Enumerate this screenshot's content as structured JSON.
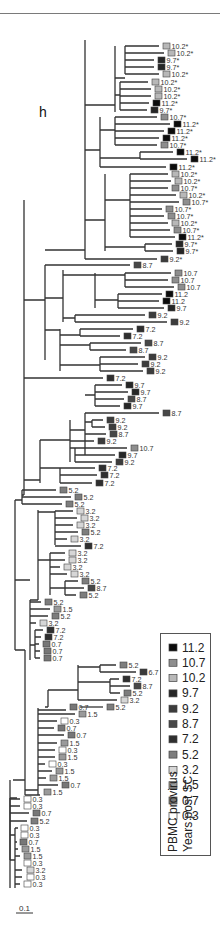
{
  "figure": {
    "panel_label": "h",
    "scale_bar": {
      "label": "0.1",
      "x1": 16,
      "x2": 33,
      "y": 913
    }
  },
  "legend": {
    "title_line1": "PBMC provirus",
    "title_line2": "Years post SC",
    "items": [
      {
        "label": "11.2",
        "color": "#0c0c0c"
      },
      {
        "label": "10.7",
        "color": "#8e8e8e"
      },
      {
        "label": "10.2",
        "color": "#b8b8b8"
      },
      {
        "label": "9.7",
        "color": "#262626"
      },
      {
        "label": "9.2",
        "color": "#3c3c3c"
      },
      {
        "label": "8.7",
        "color": "#474747"
      },
      {
        "label": "7.2",
        "color": "#2f2f2f"
      },
      {
        "label": "5.2",
        "color": "#7d7d7d"
      },
      {
        "label": "3.2",
        "color": "#d6d6d6"
      },
      {
        "label": "1.5",
        "color": "#9a9a9a"
      },
      {
        "label": "0.7",
        "color": "#777777"
      },
      {
        "label": "0.3",
        "color": "#ffffff"
      }
    ]
  },
  "chart_data": {
    "type": "phylogenetic_tree",
    "title": "h",
    "legend_title": [
      "PBMC provirus",
      "Years post SC"
    ],
    "scale_bar": "0.1",
    "leaves": [
      {
        "x": 163,
        "y": 46,
        "label": "10.2*"
      },
      {
        "x": 168,
        "y": 53,
        "label": "10.2*"
      },
      {
        "x": 158,
        "y": 60,
        "label": "9.7*"
      },
      {
        "x": 158,
        "y": 67,
        "label": "9.7*"
      },
      {
        "x": 163,
        "y": 74,
        "label": "10.2*"
      },
      {
        "x": 152,
        "y": 82,
        "label": "10.2*"
      },
      {
        "x": 155,
        "y": 89,
        "label": "10.2*"
      },
      {
        "x": 155,
        "y": 96,
        "label": "10.2*"
      },
      {
        "x": 153,
        "y": 103,
        "label": "11.2*"
      },
      {
        "x": 151,
        "y": 110,
        "label": "9.7*"
      },
      {
        "x": 161,
        "y": 117,
        "label": "10.7*"
      },
      {
        "x": 174,
        "y": 124,
        "label": "11.2*"
      },
      {
        "x": 168,
        "y": 131,
        "label": "11.2*"
      },
      {
        "x": 163,
        "y": 138,
        "label": "11.2*"
      },
      {
        "x": 161,
        "y": 145,
        "label": "10.7*"
      },
      {
        "x": 177,
        "y": 152,
        "label": "11.2*"
      },
      {
        "x": 191,
        "y": 159,
        "label": "11.2*"
      },
      {
        "x": 170,
        "y": 167,
        "label": "11.2*"
      },
      {
        "x": 172,
        "y": 174,
        "label": "10.2*"
      },
      {
        "x": 175,
        "y": 181,
        "label": "10.2*"
      },
      {
        "x": 172,
        "y": 188,
        "label": "10.7*"
      },
      {
        "x": 180,
        "y": 195,
        "label": "10.2*"
      },
      {
        "x": 183,
        "y": 202,
        "label": "10.7*"
      },
      {
        "x": 166,
        "y": 209,
        "label": "10.7*"
      },
      {
        "x": 168,
        "y": 216,
        "label": "10.7*"
      },
      {
        "x": 172,
        "y": 223,
        "label": "10.2*"
      },
      {
        "x": 174,
        "y": 230,
        "label": "10.7*"
      },
      {
        "x": 179,
        "y": 237,
        "label": "11.2*"
      },
      {
        "x": 176,
        "y": 244,
        "label": "9.7*"
      },
      {
        "x": 177,
        "y": 251,
        "label": "9.7*"
      },
      {
        "x": 161,
        "y": 259,
        "label": "9.2*"
      },
      {
        "x": 134,
        "y": 265,
        "label": "8.7"
      },
      {
        "x": 175,
        "y": 273,
        "label": "10.7"
      },
      {
        "x": 172,
        "y": 280,
        "label": "10.7"
      },
      {
        "x": 178,
        "y": 287,
        "label": "10.7"
      },
      {
        "x": 166,
        "y": 294,
        "label": "11.2"
      },
      {
        "x": 163,
        "y": 301,
        "label": "11.2"
      },
      {
        "x": 168,
        "y": 308,
        "label": "9.7"
      },
      {
        "x": 149,
        "y": 315,
        "label": "9.2"
      },
      {
        "x": 171,
        "y": 322,
        "label": "9.2"
      },
      {
        "x": 137,
        "y": 329,
        "label": "7.2"
      },
      {
        "x": 124,
        "y": 336,
        "label": "7.2"
      },
      {
        "x": 145,
        "y": 343,
        "label": "8.7"
      },
      {
        "x": 130,
        "y": 350,
        "label": "8.7"
      },
      {
        "x": 149,
        "y": 357,
        "label": "9.2"
      },
      {
        "x": 142,
        "y": 364,
        "label": "9.2"
      },
      {
        "x": 147,
        "y": 371,
        "label": "9.2"
      },
      {
        "x": 107,
        "y": 378,
        "label": "7.2"
      },
      {
        "x": 126,
        "y": 385,
        "label": "9.7"
      },
      {
        "x": 132,
        "y": 392,
        "label": "9.7"
      },
      {
        "x": 128,
        "y": 399,
        "label": "8.7"
      },
      {
        "x": 124,
        "y": 406,
        "label": "9.7"
      },
      {
        "x": 163,
        "y": 413,
        "label": "8.7"
      },
      {
        "x": 107,
        "y": 420,
        "label": "9.2"
      },
      {
        "x": 109,
        "y": 427,
        "label": "9.2"
      },
      {
        "x": 110,
        "y": 434,
        "label": "8.7"
      },
      {
        "x": 98,
        "y": 441,
        "label": "9.2"
      },
      {
        "x": 131,
        "y": 448,
        "label": "10.7"
      },
      {
        "x": 119,
        "y": 455,
        "label": "9.7"
      },
      {
        "x": 116,
        "y": 462,
        "label": "9.2"
      },
      {
        "x": 99,
        "y": 468,
        "label": "7.2"
      },
      {
        "x": 101,
        "y": 475,
        "label": "7.2"
      },
      {
        "x": 96,
        "y": 483,
        "label": "7.2"
      },
      {
        "x": 60,
        "y": 490,
        "label": "5.2"
      },
      {
        "x": 75,
        "y": 497,
        "label": "5.2"
      },
      {
        "x": 66,
        "y": 504,
        "label": "5.2"
      },
      {
        "x": 77,
        "y": 511,
        "label": "3.2"
      },
      {
        "x": 81,
        "y": 518,
        "label": "3.2"
      },
      {
        "x": 77,
        "y": 525,
        "label": "3.2"
      },
      {
        "x": 82,
        "y": 532,
        "label": "5.2"
      },
      {
        "x": 71,
        "y": 539,
        "label": "3.2"
      },
      {
        "x": 85,
        "y": 546,
        "label": "7.2"
      },
      {
        "x": 69,
        "y": 553,
        "label": "3.2"
      },
      {
        "x": 69,
        "y": 560,
        "label": "3.2"
      },
      {
        "x": 64,
        "y": 567,
        "label": "3.2"
      },
      {
        "x": 71,
        "y": 574,
        "label": "3.2"
      },
      {
        "x": 82,
        "y": 581,
        "label": "5.2"
      },
      {
        "x": 88,
        "y": 588,
        "label": "8.7"
      },
      {
        "x": 80,
        "y": 595,
        "label": "5.2"
      },
      {
        "x": 45,
        "y": 602,
        "label": "5.2"
      },
      {
        "x": 54,
        "y": 609,
        "label": "1.5"
      },
      {
        "x": 52,
        "y": 616,
        "label": "5.2"
      },
      {
        "x": 40,
        "y": 623,
        "label": "3.2"
      },
      {
        "x": 47,
        "y": 630,
        "label": "7.2"
      },
      {
        "x": 45,
        "y": 637,
        "label": "7.2"
      },
      {
        "x": 43,
        "y": 644,
        "label": "0.7"
      },
      {
        "x": 44,
        "y": 651,
        "label": "0.7"
      },
      {
        "x": 44,
        "y": 658,
        "label": "0.7"
      },
      {
        "x": 120,
        "y": 665,
        "label": "5.2"
      },
      {
        "x": 140,
        "y": 672,
        "label": "6.7"
      },
      {
        "x": 123,
        "y": 679,
        "label": "7.2"
      },
      {
        "x": 134,
        "y": 686,
        "label": "8.7"
      },
      {
        "x": 124,
        "y": 693,
        "label": "5.2"
      },
      {
        "x": 121,
        "y": 700,
        "label": "3.2"
      },
      {
        "x": 107,
        "y": 707,
        "label": "5.2"
      },
      {
        "x": 70,
        "y": 707,
        "label": "0.7"
      },
      {
        "x": 79,
        "y": 714,
        "label": "1.5"
      },
      {
        "x": 61,
        "y": 721,
        "label": "0.3"
      },
      {
        "x": 58,
        "y": 728,
        "label": "0.7"
      },
      {
        "x": 68,
        "y": 735,
        "label": "0.7"
      },
      {
        "x": 61,
        "y": 743,
        "label": "1.5"
      },
      {
        "x": 59,
        "y": 750,
        "label": "0.3"
      },
      {
        "x": 59,
        "y": 757,
        "label": "1.5"
      },
      {
        "x": 49,
        "y": 764,
        "label": "0.3"
      },
      {
        "x": 56,
        "y": 771,
        "label": "1.5"
      },
      {
        "x": 50,
        "y": 778,
        "label": "1.5"
      },
      {
        "x": 62,
        "y": 785,
        "label": "0.7"
      },
      {
        "x": 44,
        "y": 792,
        "label": "1.5"
      },
      {
        "x": 24,
        "y": 799,
        "label": "0.3"
      },
      {
        "x": 24,
        "y": 806,
        "label": "0.3"
      },
      {
        "x": 33,
        "y": 813,
        "label": "0.7"
      },
      {
        "x": 31,
        "y": 821,
        "label": "5.2"
      },
      {
        "x": 21,
        "y": 828,
        "label": "0.3"
      },
      {
        "x": 21,
        "y": 835,
        "label": "0.3"
      },
      {
        "x": 20,
        "y": 842,
        "label": "0.7"
      },
      {
        "x": 22,
        "y": 849,
        "label": "1.5"
      },
      {
        "x": 24,
        "y": 856,
        "label": "1.5"
      },
      {
        "x": 24,
        "y": 863,
        "label": "0.3"
      },
      {
        "x": 27,
        "y": 870,
        "label": "3.2"
      },
      {
        "x": 27,
        "y": 877,
        "label": "0.3"
      },
      {
        "x": 24,
        "y": 884,
        "label": "0.3"
      }
    ]
  },
  "tree": {
    "branches": [
      "M10,888 V798 M10,798 H17",
      "M10,860 H15 M15,828 V888 M15,828 H18 M15,842 H17 M15,849 H18 M15,856 H20 M15,870 H22 M15,877 H22 M15,884 H20",
      "M10,799 H20 M10,806 H20 M10,813 H29 M10,821 H27 M10,835 H15",
      "M10,780 V860",
      "M13,780 H25 M25,650 V795 M25,795 H40",
      "M25,790 H38 M38,708 V795",
      "M38,710 H66 M38,714 H75 M38,721 H57 M38,728 H54 M38,735 H64 M38,743 H57 M38,750 H55 M38,757 H55 M38,764 H45 M38,771 H52 M38,778 H46 M38,785 H58",
      "M45,707 H48 M48,690 V707",
      "M48,690 H78 M78,665 V700",
      "M78,667 H100 M100,665 V672 M100,665 H116 M100,672 H136",
      "M78,682 H110 M110,679 V693 M110,679 H119 M110,686 H130 M110,693 H120",
      "M78,700 H117",
      "M80,707 H103",
      "M15,650 V500 M15,650 H25",
      "M15,580 H30 M30,600 V660 M30,602 H41 M30,609 H50 M30,616 H48 M30,623 H36",
      "M30,645 H35 M35,630 V658 M35,630 H43 M35,637 H41 M35,644 H39 M35,651 H40 M35,658 H40",
      "M30,600 H38 M38,510 V600",
      "M38,512 H55 M55,511 V545 M55,511 H73 M55,518 H77 M55,525 H73 M55,532 H78 M55,539 H67 M55,546 H81",
      "M38,560 H50 M50,553 V595 M50,553 H65 M50,560 H65 M50,567 H60 M50,574 H67 M50,588 H65 M65,581 V595 M65,581 H78 M65,588 H84 M65,595 H76",
      "M15,500 H22 M22,490 V504 M22,490 H56 M22,497 H71 M22,504 H62",
      "M22,495 H24 M24,200 V495",
      "M24,480 H40 M40,440 V483 M40,468 H60 M60,468 V483 M60,468 H95 M60,475 H97 M60,483 H92",
      "M40,440 H70 M70,420 V462",
      "M70,430 H85 M85,413 V455",
      "M85,395 H95 M95,385 V406 M95,385 H122 M95,392 H128 M95,399 H124 M95,406 H120 M85,413 H159",
      "M85,422 H92 M92,420 V427 M92,420 H103 M92,427 H105 M85,434 H106",
      "M70,441 H94 M70,448 H75 M75,448 V462 M75,448 H127 M75,455 H115 M75,462 H112",
      "M24,378 H103",
      "M24,300 H45 M45,265 V360",
      "M45,265 H130",
      "M45,330 H60 M60,329 V371",
      "M60,335 H80 M80,329 V336 M80,329 H133 M80,336 H120",
      "M60,345 H90 M90,343 V350 M90,343 H141 M90,350 H126",
      "M60,365 H100 M100,357 V371 M100,357 H145 M100,364 H138 M100,371 H143",
      "M45,298 H63 M63,270 V322",
      "M63,275 H95 M95,273 V308",
      "M95,275 H125 M125,273 V287 M125,273 H171 M125,280 H168 M125,287 H174",
      "M95,300 H118 M118,294 V308 M118,294 H162 M118,301 H159 M118,308 H164",
      "M63,318 H75 M75,315 V322 M75,315 H145 M75,322 H167",
      "M45,250 H85 M85,40 V259",
      "M85,259 H157",
      "M85,105 H115 M115,46 V112",
      "M115,78 H125 M125,46 V74 M125,46 H159 M125,53 H164 M125,60 H154 M125,67 H154 M125,74 H159",
      "M115,95 H120 M120,82 V110 M120,82 H148 M120,89 H151 M120,96 H151 M120,103 H149 M120,110 H147",
      "M85,150 H100 M100,117 V167",
      "M100,130 H115 M115,117 V145 M115,117 H157 M115,124 H170 M115,131 H164 M115,138 H159 M115,145 H157",
      "M100,158 H140 M140,152 V159 M140,152 H173 M140,159 H187 M100,167 H166",
      "M85,220 H105 M105,174 V251",
      "M105,200 H130 M130,174 V237 M130,174 H168 M130,181 H171 M130,188 H168 M130,195 H176 M130,202 H179 M130,209 H162 M130,216 H164 M130,223 H168 M130,230 H170 M130,237 H175",
      "M105,247 H145 M145,244 V251 M145,244 H172 M145,251 H173"
    ]
  }
}
